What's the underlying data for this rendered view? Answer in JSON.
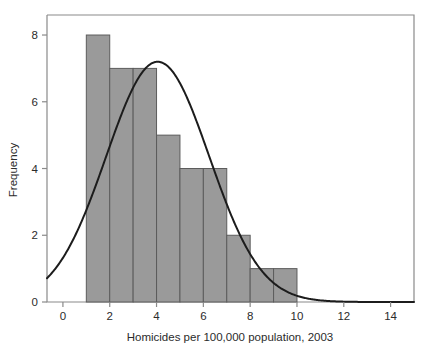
{
  "chart_data": {
    "type": "bar",
    "title": "",
    "subtitle": "",
    "xlabel": "Homicides per 100,000 population, 2003",
    "ylabel": "Frequency",
    "xlim": [
      -0.68,
      15.0
    ],
    "ylim": [
      0,
      8.6
    ],
    "xticks": [
      0,
      2,
      4,
      6,
      8,
      10,
      12,
      14
    ],
    "xtick_labels": [
      "0",
      "2",
      "4",
      "6",
      "8",
      "10",
      "12",
      "14"
    ],
    "yticks": [
      0,
      2,
      4,
      6,
      8
    ],
    "ytick_labels": [
      "0",
      "2",
      "4",
      "6",
      "8"
    ],
    "grid": false,
    "legend": null,
    "bin_edges": [
      1,
      2,
      3,
      4,
      5,
      6,
      7,
      8,
      9,
      10
    ],
    "bin_width": 1,
    "categories": [
      "1-2",
      "2-3",
      "3-4",
      "4-5",
      "5-6",
      "6-7",
      "7-8",
      "8-9",
      "9-10"
    ],
    "values": [
      8,
      7,
      7,
      5,
      4,
      4,
      2,
      1,
      1
    ],
    "bar_color": "#9a9a9a",
    "bar_edge_color": "#5c5c5c",
    "series": [
      {
        "name": "Frequency",
        "type": "bar",
        "values": [
          8,
          7,
          7,
          5,
          4,
          4,
          2,
          1,
          1
        ]
      },
      {
        "name": "Normal curve",
        "type": "line",
        "color": "#1c1c1c",
        "mean": 4.05,
        "sd": 2.2,
        "scale": 39.7,
        "x": [
          -0.68,
          0,
          1,
          2,
          3,
          4,
          5,
          6,
          7,
          8,
          9,
          10,
          11,
          12,
          13,
          14,
          15
        ],
        "y": [
          0.58,
          1.0,
          2.3,
          4.2,
          6.2,
          7.2,
          6.9,
          5.4,
          3.5,
          1.9,
          0.85,
          0.32,
          0.1,
          0.03,
          0.01,
          0.0,
          0.0
        ]
      }
    ],
    "total_count": 39
  },
  "figure": {
    "background": "#ffffff",
    "frame_color": "#8a8a8a",
    "text_color": "#2b2b2b"
  }
}
